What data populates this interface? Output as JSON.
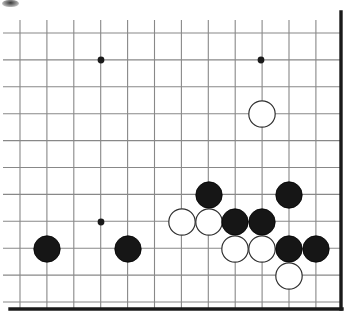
{
  "figure": {
    "kind": "go-board-diagram",
    "caption": ""
  },
  "board": {
    "name": "go-board",
    "origin_x": 20,
    "origin_y": 33,
    "spacing": 26.9,
    "cols": 12,
    "rows": 10,
    "line_color": "#888888",
    "line_width": 1.1,
    "edge_color": "#1a1a1a",
    "edge_width": 3.4,
    "background": "#ffffff",
    "right_edge_x": 341,
    "bottom_edge_y": 309,
    "edges_drawn": [
      "right",
      "bottom"
    ],
    "star_point_radius": 3.4,
    "star_point_color": "#1a1a1a",
    "star_points": [
      {
        "name": "star-point-upper-left",
        "x": 101,
        "y": 60
      },
      {
        "name": "star-point-upper-right",
        "x": 261,
        "y": 60
      },
      {
        "name": "star-point-lower-left",
        "x": 101,
        "y": 222
      }
    ]
  },
  "stones": {
    "radius": 13.2,
    "black_fill": "#161616",
    "black_stroke": "#000000",
    "white_fill": "#ffffff",
    "white_stroke": "#303030",
    "white_stroke_width": 1.2,
    "items": [
      {
        "name": "white-stone-1",
        "color": "white",
        "x": 262,
        "y": 114
      },
      {
        "name": "black-stone-1",
        "color": "black",
        "x": 209,
        "y": 195
      },
      {
        "name": "black-stone-2",
        "color": "black",
        "x": 289,
        "y": 195
      },
      {
        "name": "white-stone-2",
        "color": "white",
        "x": 182,
        "y": 222
      },
      {
        "name": "white-stone-3",
        "color": "white",
        "x": 209,
        "y": 222
      },
      {
        "name": "black-stone-3",
        "color": "black",
        "x": 235,
        "y": 222
      },
      {
        "name": "black-stone-4",
        "color": "black",
        "x": 262,
        "y": 222
      },
      {
        "name": "black-stone-5",
        "color": "black",
        "x": 47,
        "y": 249
      },
      {
        "name": "black-stone-6",
        "color": "black",
        "x": 128,
        "y": 249
      },
      {
        "name": "white-stone-4",
        "color": "white",
        "x": 235,
        "y": 249
      },
      {
        "name": "white-stone-5",
        "color": "white",
        "x": 262,
        "y": 249
      },
      {
        "name": "black-stone-7",
        "color": "black",
        "x": 289,
        "y": 249
      },
      {
        "name": "black-stone-8",
        "color": "black",
        "x": 316,
        "y": 249
      },
      {
        "name": "white-stone-6",
        "color": "white",
        "x": 289,
        "y": 276
      }
    ]
  },
  "artifacts": {
    "smudge_label": "scan-artifact"
  }
}
